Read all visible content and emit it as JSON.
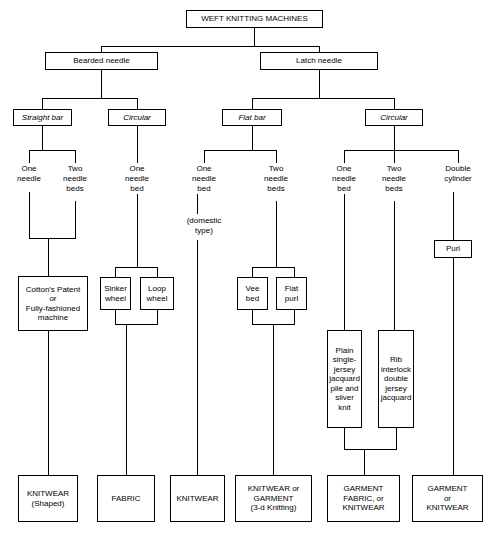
{
  "diagram": {
    "title": "WEFT KNITTING MACHINES",
    "tier2": [
      {
        "label": "Bearded needle"
      },
      {
        "label": "Latch needle"
      }
    ],
    "tier3": [
      {
        "label": "Straight bar"
      },
      {
        "label": "Circular"
      },
      {
        "label": "Flat bar"
      },
      {
        "label": "Circular"
      }
    ],
    "tier4": [
      {
        "label": "One\nneedle"
      },
      {
        "label": "Two\nneedle\nbeds"
      },
      {
        "label": "One\nneedle\nbed"
      },
      {
        "label": "One\nneedle\nbed"
      },
      {
        "label": "Two\nneedle\nbeds"
      },
      {
        "label": "One\nneedle\nbed"
      },
      {
        "label": "Two\nneedle\nbeds"
      },
      {
        "label": "Double\ncylinder"
      }
    ],
    "annotations": [
      {
        "label": "(domestic\ntype)"
      }
    ],
    "tier5": [
      {
        "label": "Purl"
      },
      {
        "label": "Cotton's Patent\nor\nFully-fashioned\nmachine"
      },
      {
        "label": "Sinker\nwheel"
      },
      {
        "label": "Loop\nwheel"
      },
      {
        "label": "Vee\nbed"
      },
      {
        "label": "Flat\npurl"
      },
      {
        "label": "Plain\nsingle-\njersey\njacquard\npile and\nsliver\nknit"
      },
      {
        "label": "Rib\ninterlock\ndouble\njersey\njacquard"
      }
    ],
    "outputs": [
      {
        "label": "KNITWEAR\n(Shaped)"
      },
      {
        "label": "FABRIC"
      },
      {
        "label": "KNITWEAR"
      },
      {
        "label": "KNITWEAR or\nGARMENT\n(3-d Knitting)"
      },
      {
        "label": "GARMENT\nFABRIC, or\nKNITWEAR"
      },
      {
        "label": "GARMENT\nor\nKNITWEAR"
      }
    ]
  }
}
